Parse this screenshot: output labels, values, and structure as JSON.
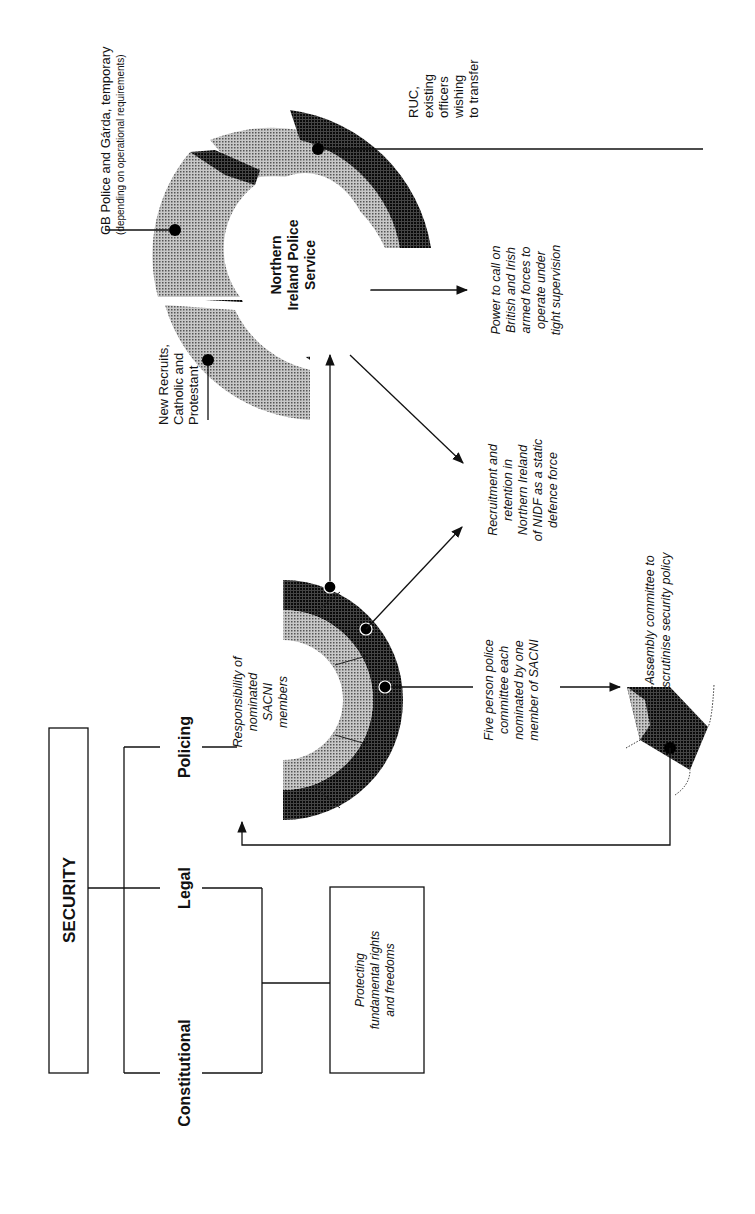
{
  "title": "SECURITY",
  "orientation": "rotated-90-ccw",
  "branches": [
    {
      "id": "constitutional",
      "label": "Constitutional"
    },
    {
      "id": "legal",
      "label": "Legal"
    },
    {
      "id": "policing",
      "label": "Policing"
    }
  ],
  "rights_box": {
    "lines": [
      "Protecting",
      "fundamental rights",
      "and freedoms"
    ]
  },
  "sacni": {
    "lines": [
      "Responsibility of",
      "nominated",
      "SACNI",
      "members"
    ]
  },
  "police_committee": {
    "lines": [
      "Five person police",
      "committee each",
      "nominated by one",
      "member of SACNI"
    ]
  },
  "assembly_committee": {
    "lines": [
      "Assembly committee to",
      "scrutinise security policy"
    ]
  },
  "nidf": {
    "lines": [
      "Recruitment and",
      "retention in",
      "Northern Ireland",
      "of NIDF as a static",
      "defence force"
    ]
  },
  "nips": {
    "lines": [
      "Northern",
      "Ireland Police",
      "Service"
    ]
  },
  "armed_forces": {
    "lines": [
      "Power to call on",
      "British and Irish",
      "armed forces to",
      "operate under",
      "tight supervision"
    ]
  },
  "segments": {
    "new_recruits": {
      "lines": [
        "New Recruits,",
        "Catholic and",
        "Protestant"
      ]
    },
    "gb_police": {
      "lines": [
        "GB Police and Gárda, temporary"
      ],
      "note": "(depending on operational requirements)"
    },
    "ruc": {
      "lines": [
        "RUC,",
        "existing",
        "officers",
        "wishing",
        "to transfer"
      ]
    }
  },
  "colors": {
    "line": "#111111",
    "light_fill": "#9a9a9a",
    "mid_fill": "#6e6e6e",
    "dark_fill": "#2f2f2f",
    "background": "#ffffff"
  }
}
